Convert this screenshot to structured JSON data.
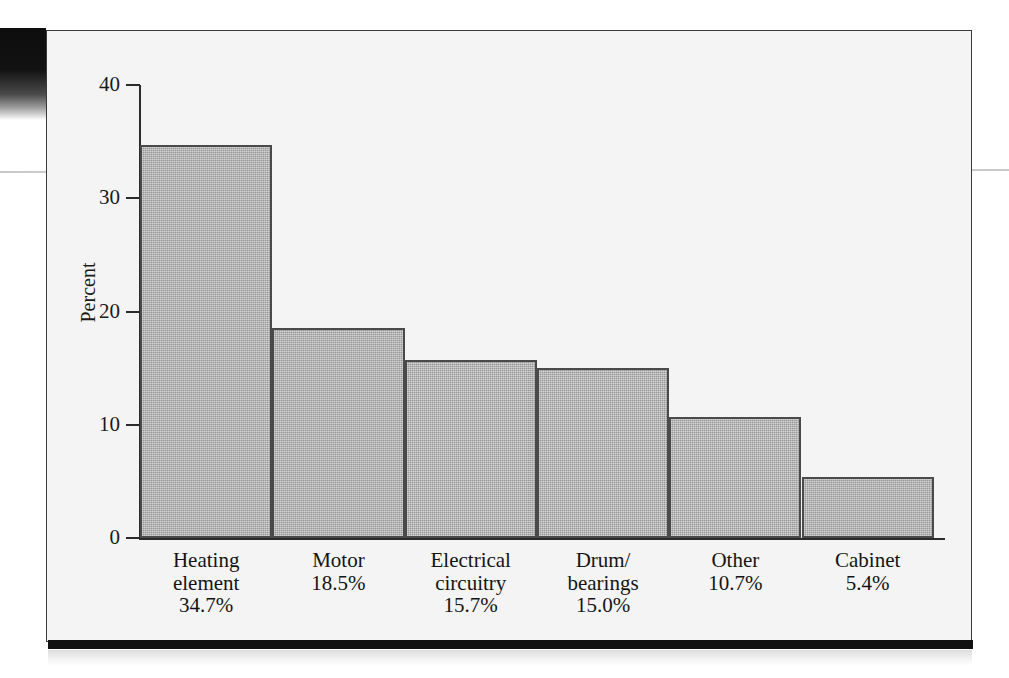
{
  "chart_data": {
    "type": "bar",
    "title": "",
    "subtitle": "",
    "xlabel": "",
    "ylabel": "Percent",
    "ylim": [
      0,
      40
    ],
    "yticks": [
      0,
      10,
      20,
      30,
      40
    ],
    "ytick_labels": [
      "0",
      "10",
      "20",
      "30",
      "40"
    ],
    "grid": false,
    "legend": null,
    "categories": [
      "Heating\nelement",
      "Motor",
      "Electrical\ncircuitry",
      "Drum/\nbearings",
      "Other",
      "Cabinet"
    ],
    "values": [
      34.7,
      18.5,
      15.7,
      15.0,
      10.7,
      5.4
    ],
    "data_labels": [
      "34.7%",
      "18.5%",
      "15.7%",
      "15.0%",
      "10.7%",
      "5.4%"
    ],
    "bar_fill_color": "#a8a8a8",
    "bar_edge_color": "#4a4a4a",
    "panel_background": "#f4f4f4",
    "axis_color": "#2b2b2b"
  },
  "axis": {
    "y_title": "Percent",
    "ticks": [
      {
        "label": "40",
        "value": 40
      },
      {
        "label": "30",
        "value": 30
      },
      {
        "label": "20",
        "value": 20
      },
      {
        "label": "10",
        "value": 10
      },
      {
        "label": "0",
        "value": 0
      }
    ]
  },
  "bars": [
    {
      "name": "Heating\nelement",
      "percent": "34.7%",
      "value": 34.7
    },
    {
      "name": "Motor",
      "percent": "18.5%",
      "value": 18.5
    },
    {
      "name": "Electrical\ncircuitry",
      "percent": "15.7%",
      "value": 15.7
    },
    {
      "name": "Drum/\nbearings",
      "percent": "15.0%",
      "value": 15.0
    },
    {
      "name": "Other",
      "percent": "10.7%",
      "value": 10.7
    },
    {
      "name": "Cabinet",
      "percent": "5.4%",
      "value": 5.4
    }
  ]
}
